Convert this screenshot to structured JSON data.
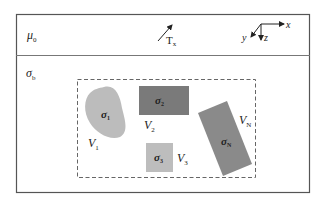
{
  "diagram": {
    "layers": {
      "air": {
        "label": "μ",
        "subscript": "0"
      },
      "earth": {
        "label": "σ",
        "subscript": "b"
      }
    },
    "transmitter": {
      "label": "T",
      "subscript": "x"
    },
    "axes": {
      "x": "x",
      "y": "y",
      "z": "z"
    },
    "anomalies": [
      {
        "id": "1",
        "conductivity": "σ",
        "cond_sub": "1",
        "volume": "V",
        "vol_sub": "1",
        "shape": "blob",
        "color": "#bcbcbc"
      },
      {
        "id": "2",
        "conductivity": "σ",
        "cond_sub": "2",
        "volume": "V",
        "vol_sub": "2",
        "shape": "rectangle",
        "color": "#7a7a7a"
      },
      {
        "id": "3",
        "conductivity": "σ",
        "cond_sub": "3",
        "volume": "V",
        "vol_sub": "3",
        "shape": "square",
        "color": "#bdbdbd"
      },
      {
        "id": "N",
        "conductivity": "σ",
        "cond_sub": "N",
        "volume": "V",
        "vol_sub": "N",
        "shape": "rotated-rectangle",
        "color": "#8a8a8a"
      }
    ],
    "colors": {
      "frame": "#555555",
      "dashed": "#666666"
    }
  }
}
